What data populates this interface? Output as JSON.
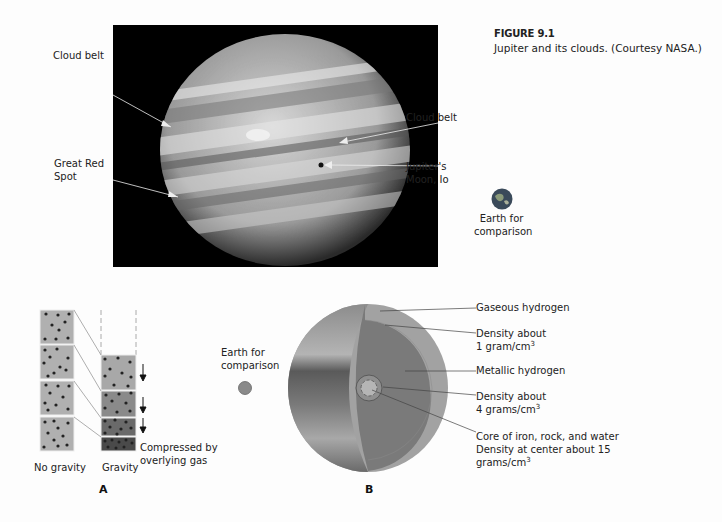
{
  "caption": {
    "figure_number": "FIGURE 9.1",
    "text": "Jupiter and its clouds. (Courtesy NASA.)"
  },
  "photo_labels": {
    "cloud_belt_left": "Cloud belt",
    "great_red_spot_line1": "Great Red",
    "great_red_spot_line2": "Spot",
    "cloud_belt_right": "Cloud belt",
    "io_line1": "Jupiter's",
    "io_line2": "Moon, Io",
    "earth_top_line1": "Earth for",
    "earth_top_line2": "comparison"
  },
  "panel_a": {
    "letter": "A",
    "no_gravity_label": "No gravity",
    "gravity_label": "Gravity",
    "compressed_line1": "Compressed by",
    "compressed_line2": "overlying gas"
  },
  "panel_b": {
    "letter": "B",
    "earth_line1": "Earth for",
    "earth_line2": "comparison",
    "layers": [
      {
        "label": "Gaseous hydrogen"
      },
      {
        "label_line1": "Density about",
        "label_line2": "1 gram/cm",
        "sup": "3"
      },
      {
        "label": "Metallic hydrogen"
      },
      {
        "label_line1": "Density about",
        "label_line2": "4 grams/cm",
        "sup": "3"
      },
      {
        "label_line1": "Core of iron, rock, and water",
        "label_line2": "Density at center about 15",
        "label_line3": "grams/cm",
        "sup": "3"
      }
    ]
  },
  "colors": {
    "background": "#fdfdfd",
    "photo_bg": "#000000",
    "outer_shell": "#9a9a9a",
    "inner_layer": "#6e6e6e",
    "box_light": "#b0b0b0",
    "box_dark": "#4a4a4a"
  }
}
